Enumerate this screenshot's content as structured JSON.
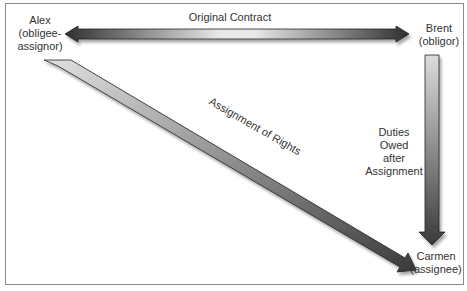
{
  "diagram": {
    "parties": {
      "alex": {
        "name": "Alex",
        "role": "(obligee-",
        "role2": "assignor)"
      },
      "brent": {
        "name": "Brent",
        "role": "(obligor)"
      },
      "carmen": {
        "name": "Carmen",
        "role": "(assignee)"
      }
    },
    "edges": {
      "original_contract": "Original Contract",
      "assignment_of_rights": "Assignment of Rights",
      "duties": [
        "Duties",
        "Owed",
        "after",
        "Assignment"
      ]
    },
    "colors": {
      "arrow_dark": "#3a3a3a",
      "arrow_light": "#e6e6e6",
      "border": "#8a8a8a"
    }
  }
}
